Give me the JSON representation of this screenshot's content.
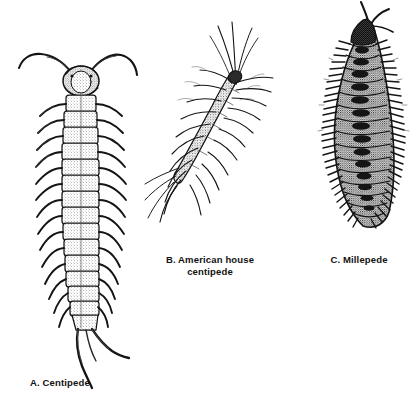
{
  "plate": {
    "background_color": "#ffffff",
    "ink_color": "#111111",
    "width": 420,
    "height": 397,
    "medium": "pen-and-ink stipple line drawing"
  },
  "figures": [
    {
      "key": "a",
      "letter": "A.",
      "name": "Centipede",
      "caption": "A. Centipede",
      "caption_lines": [
        "A. Centipede"
      ],
      "description": "Dorsal view of a centipede with rounded head, two long curving antennae, stippled segmented body, one pair of legs per segment, and long terminal cerci",
      "orientation": "vertical, head up",
      "segment_count": 15,
      "icon": "centipede-icon"
    },
    {
      "key": "b",
      "letter": "B.",
      "name": "American house centipede",
      "caption": "B. American house\ncentipede",
      "caption_lines": [
        "B. American house",
        "centipede"
      ],
      "description": "Diagonal view of Scutigera with very long thin curving legs radiating outward and long trailing antennae",
      "orientation": "diagonal, head upper right",
      "segment_count": 15,
      "icon": "house-centipede-icon"
    },
    {
      "key": "c",
      "letter": "C.",
      "name": "Millepede",
      "caption": "C. Millepede",
      "caption_lines": [
        "C. Millepede"
      ],
      "description": "Dark heavily stippled curved body with many short legs, two pairs per segment, antennae at top",
      "orientation": "vertical curved, head up",
      "segment_count": 22,
      "icon": "millepede-icon"
    }
  ]
}
